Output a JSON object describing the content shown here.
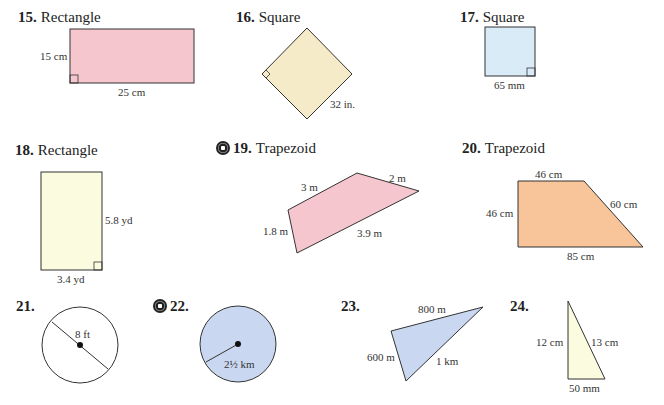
{
  "problems": [
    {
      "number": "15.",
      "shape": "Rectangle",
      "labels": [
        "15 cm",
        "25 cm"
      ],
      "fill": "#f6c6cf"
    },
    {
      "number": "16.",
      "shape": "Square",
      "labels": [
        "32 in."
      ],
      "fill": "#f6ebc8"
    },
    {
      "number": "17.",
      "shape": "Square",
      "labels": [
        "65 mm"
      ],
      "fill": "#d9ebf7"
    },
    {
      "number": "18.",
      "shape": "Rectangle",
      "labels": [
        "5.8 yd",
        "3.4 yd"
      ],
      "fill": "#fbfbdf"
    },
    {
      "number": "19.",
      "shape": "Trapezoid",
      "labels": [
        "3 m",
        "2 m",
        "1.8 m",
        "3.9 m"
      ],
      "fill": "#f6c6cf",
      "cd_icon": true
    },
    {
      "number": "20.",
      "shape": "Trapezoid",
      "labels": [
        "46 cm",
        "46 cm",
        "60 cm",
        "85 cm"
      ],
      "fill": "#f8c49a"
    },
    {
      "number": "21.",
      "shape": "",
      "labels": [
        "8 ft"
      ],
      "fill": "#ffffff"
    },
    {
      "number": "22.",
      "shape": "",
      "labels": [
        "2½ km"
      ],
      "fill": "#c9d8f0",
      "cd_icon": true
    },
    {
      "number": "23.",
      "shape": "",
      "labels": [
        "800 m",
        "600 m",
        "1 km"
      ],
      "fill": "#c9d8f0"
    },
    {
      "number": "24.",
      "shape": "",
      "labels": [
        "12 cm",
        "13 cm",
        "50 mm"
      ],
      "fill": "#fbfbdf"
    }
  ]
}
